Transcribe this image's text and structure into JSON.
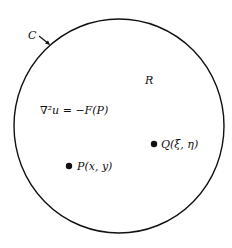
{
  "diagram": {
    "boundary_label": "C",
    "region_label": "R",
    "equation": "∇²u = −F(P)",
    "points": [
      {
        "name": "Q",
        "label": "Q(ξ, η)"
      },
      {
        "name": "P",
        "label": "P(x, y)"
      }
    ],
    "colors": {
      "stroke": "#111111",
      "background": "#ffffff"
    }
  }
}
